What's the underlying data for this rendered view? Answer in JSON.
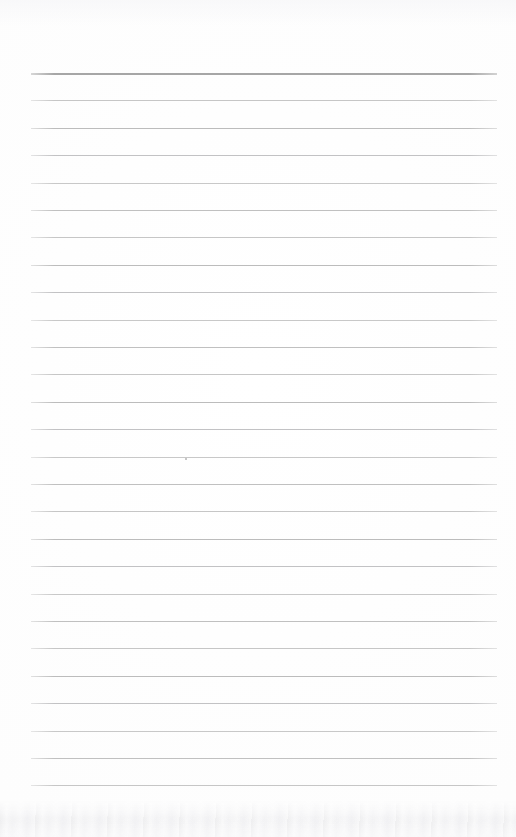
{
  "document": {
    "kind": "scanned-lined-paper",
    "title": "Blank ruled page",
    "content_text": "",
    "page_width": 516,
    "page_height": 837,
    "background_color": "#fefefe"
  },
  "ruling": {
    "line_color": "#c0c0c0",
    "header_line_color": "#a6a6a6",
    "line_count": 27,
    "left_x": 31,
    "right_x": 497,
    "first_line_y": 73,
    "line_spacing": 27.4,
    "header_line_thickness": 2,
    "line_thickness": 1,
    "lines_y": [
      73,
      100.4,
      127.8,
      155.2,
      182.6,
      210,
      237.4,
      264.8,
      292.2,
      319.6,
      347,
      374.4,
      401.8,
      429.2,
      456.6,
      484,
      511.4,
      538.8,
      566.2,
      593.6,
      621,
      648.4,
      675.8,
      703.2,
      730.6,
      758,
      785.4
    ]
  },
  "margins": {
    "top_margin_px": 73,
    "bottom_margin_px": 52,
    "left_margin_px": 31,
    "right_margin_px": 19
  },
  "artifacts": {
    "bottom_scan_shadow": {
      "top": 800,
      "height": 37,
      "tint": "#ebebee"
    },
    "specks": [
      {
        "x": 185,
        "y": 458
      }
    ]
  }
}
